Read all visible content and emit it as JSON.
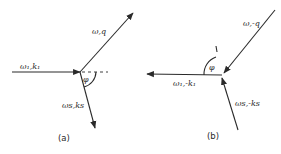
{
  "figure": {
    "panels": [
      {
        "caption": "(a)",
        "vectors": [
          {
            "label": "ω₁,k₁",
            "role": "incident"
          },
          {
            "label": "ω,q",
            "role": "excitation"
          },
          {
            "label": "ωs,ks",
            "role": "scattered"
          }
        ],
        "angle_label": "φ"
      },
      {
        "caption": "(b)",
        "vectors": [
          {
            "label": "ω₁,-k₁",
            "role": "incident"
          },
          {
            "label": "ω,-q",
            "role": "excitation"
          },
          {
            "label": "ωs,-ks",
            "role": "scattered"
          }
        ],
        "angle_label": "φ"
      }
    ],
    "colors": {
      "ink": "#2a2a2a",
      "background": "#ffffff"
    }
  }
}
